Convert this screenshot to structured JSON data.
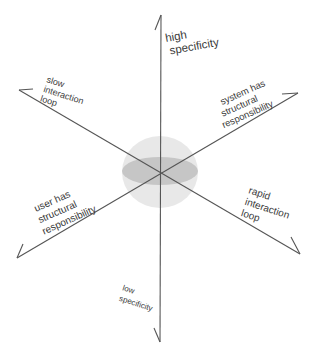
{
  "diagram": {
    "center": [
      160,
      172
    ],
    "colors": {
      "axis": "#555555",
      "sphere": "#e6e6e6",
      "equator": "#c4c4c4",
      "text": "#3a3a3a"
    },
    "axes": [
      {
        "id": "high-specificity",
        "end": [
          161,
          15
        ]
      },
      {
        "id": "low-specificity",
        "end": [
          160,
          342
        ]
      },
      {
        "id": "slow-interaction-loop",
        "end": [
          19,
          90
        ]
      },
      {
        "id": "rapid-interaction-loop",
        "end": [
          300,
          254
        ]
      },
      {
        "id": "system-structural-responsibility",
        "end": [
          298,
          93
        ]
      },
      {
        "id": "user-structural-responsibility",
        "end": [
          17,
          258
        ]
      }
    ],
    "labels": {
      "high_specificity": [
        "high",
        "specificity"
      ],
      "low_specificity": [
        "low",
        "specificity"
      ],
      "slow_interaction_loop": [
        "slow",
        "interaction",
        "loop"
      ],
      "rapid_interaction_loop": [
        "rapid",
        "interaction",
        "loop"
      ],
      "system_structural": [
        "system has",
        "structural",
        "responsibility"
      ],
      "user_structural": [
        "user has",
        "structural",
        "responsibility"
      ]
    }
  }
}
